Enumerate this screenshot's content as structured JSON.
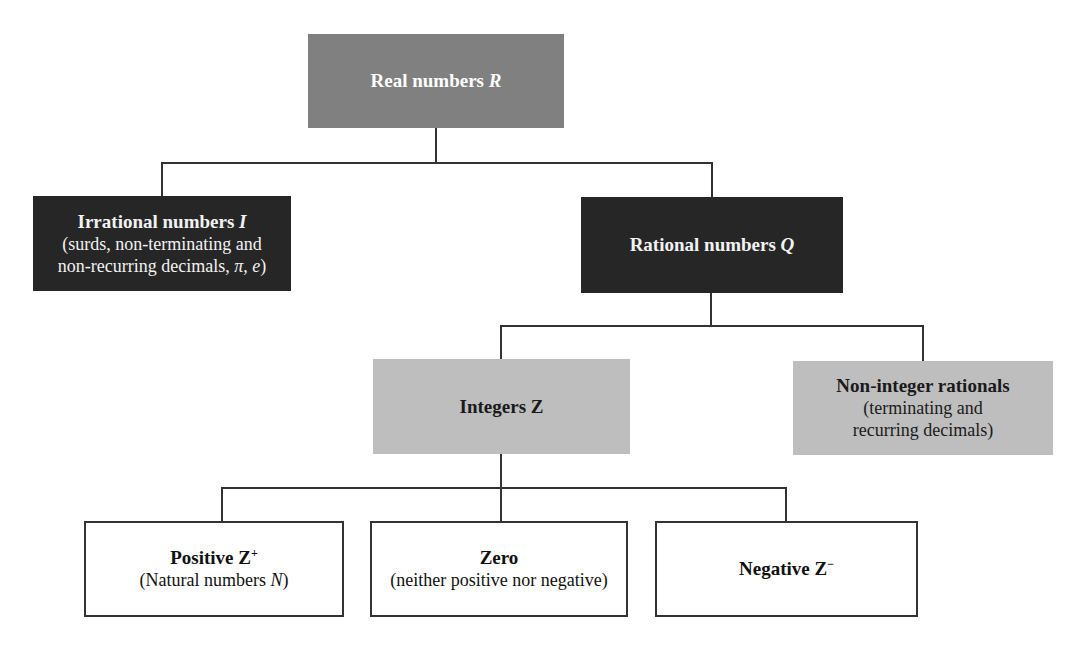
{
  "diagram": {
    "type": "tree",
    "colors": {
      "root_fill": "#808080",
      "level1_fill": "#262626",
      "level2_fill": "#bebebe",
      "level3_fill": "#ffffff",
      "connector": "#333333"
    },
    "nodes": {
      "real": {
        "title": "Real numbers ",
        "symbol": "R"
      },
      "irrational": {
        "title": "Irrational numbers ",
        "symbol": "I",
        "line1": "(surds, non-terminating and",
        "line2": "non-recurring decimals, ",
        "pi": "π",
        "comma": ", ",
        "e": "e",
        "close": ")"
      },
      "rational": {
        "title": "Rational numbers ",
        "symbol": "Q"
      },
      "integers": {
        "title": "Integers Z"
      },
      "noninteger": {
        "title": "Non-integer rationals",
        "line1": "(terminating and",
        "line2": "recurring decimals)"
      },
      "positive": {
        "title": "Positive Z",
        "sup": "+",
        "sub_prefix": "(Natural numbers ",
        "sub_symbol": "N",
        "sub_suffix": ")"
      },
      "zero": {
        "title": "Zero",
        "sub": "(neither positive nor negative)"
      },
      "negative": {
        "title": "Negative Z",
        "sup": "−"
      }
    },
    "edges": [
      [
        "real",
        "irrational"
      ],
      [
        "real",
        "rational"
      ],
      [
        "rational",
        "integers"
      ],
      [
        "rational",
        "noninteger"
      ],
      [
        "integers",
        "positive"
      ],
      [
        "integers",
        "zero"
      ],
      [
        "integers",
        "negative"
      ]
    ]
  }
}
